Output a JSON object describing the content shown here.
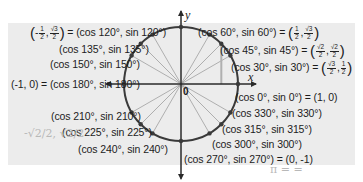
{
  "diagram": {
    "axes": {
      "x_label": "x",
      "y_label": "y",
      "origin_label": "0"
    },
    "colors": {
      "panel": "#ececec",
      "circle": "#3a3a3a",
      "radii": "#9a9a9a",
      "text": "#1c1c1c"
    },
    "points": [
      {
        "angle": 0,
        "label": "(cos 0°, sin 0°) = (1, 0)"
      },
      {
        "angle": 30,
        "label_left": "(cos 30°, sin 30°) = ",
        "value_num_x": "√3",
        "value_den_x": "2",
        "value_num_y": "1",
        "value_den_y": "2"
      },
      {
        "angle": 45,
        "label_left": "(cos 45°, sin 45°) = ",
        "value_num_x": "√2",
        "value_den_x": "2",
        "value_num_y": "√2",
        "value_den_y": "2"
      },
      {
        "angle": 60,
        "label_left": "(cos 60°, sin 60°) = ",
        "value_num_x": "1",
        "value_den_x": "2",
        "value_num_y": "√3",
        "value_den_y": "2"
      },
      {
        "angle": 120,
        "label_right": " = (cos 120°, sin 120°)",
        "value_num_x": "1",
        "value_den_x": "2",
        "value_sign_x": "-",
        "value_num_y": "√3",
        "value_den_y": "2"
      },
      {
        "angle": 135,
        "label": "(cos 135°, sin 135°)"
      },
      {
        "angle": 150,
        "label": "(cos 150°, sin 150°)"
      },
      {
        "angle": 180,
        "label": "(-1, 0) = (cos 180°, sin 180°)"
      },
      {
        "angle": 210,
        "label": "(cos 210°, sin 210°)"
      },
      {
        "angle": 225,
        "label": "(cos 225°, sin 225°)"
      },
      {
        "angle": 240,
        "label": "(cos 240°, sin 240°)"
      },
      {
        "angle": 270,
        "label": "(cos 270°, sin 270°) = (0, -1)"
      },
      {
        "angle": 300,
        "label": "(cos 300°, sin 300°)"
      },
      {
        "angle": 315,
        "label": "(cos 315°, sin 315°)"
      },
      {
        "angle": 330,
        "label": "(cos 330°, sin 330°)"
      }
    ],
    "handwriting": {
      "near_225": "-√2/2, √2/2",
      "bottom_right": "π = ="
    }
  }
}
